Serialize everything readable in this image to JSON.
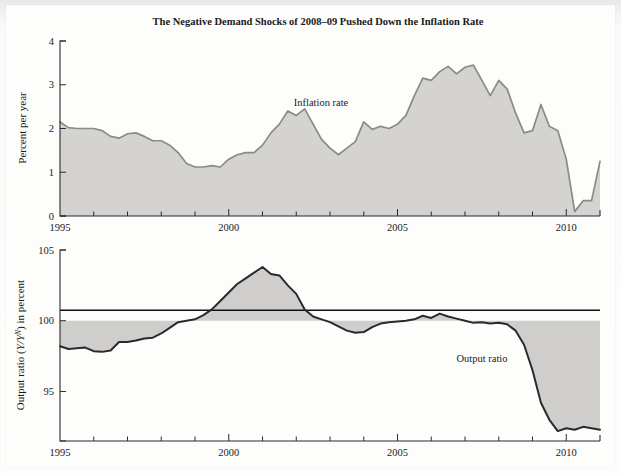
{
  "page": {
    "background_color": "#fdfdfc",
    "page_tint": "#eceaea"
  },
  "figure": {
    "title": "The Negative Demand Shocks of 2008–09 Pushed Down the Inflation Rate"
  },
  "panels": {
    "top": {
      "ylabel": "Percent per year",
      "annotation": "Inflation rate",
      "yticks": [
        "0",
        "1",
        "2",
        "3",
        "4"
      ],
      "xticks": [
        "1995",
        "2000",
        "2005",
        "2010"
      ]
    },
    "bottom": {
      "ylabel_pre": "Output ratio (",
      "ylabel_italic": "Y/Y",
      "ylabel_sup": "N",
      "ylabel_post": ") in percent",
      "ylabel_plain": "Output ratio (Y/Y^N) in percent",
      "annotation": "Output ratio",
      "yticks": [
        "95",
        "100",
        "105"
      ],
      "xticks": [
        "1995",
        "2000",
        "2005",
        "2010"
      ]
    }
  },
  "style": {
    "area_fill": "#d4d3d1",
    "line_color": "#8a8a88",
    "line_color_dark": "#2a2a2a",
    "axis_color": "#2b2b2b",
    "text_color": "#1a1a1a"
  },
  "chart_data": [
    {
      "type": "area",
      "id": "inflation-rate",
      "title": "The Negative Demand Shocks of 2008–09 Pushed Down the Inflation Rate",
      "xlabel": "",
      "ylabel": "Percent per year",
      "legend": [
        "Inflation rate"
      ],
      "legend_position": "inline-annotation",
      "grid": false,
      "xlim": [
        1995.0,
        2011.0
      ],
      "ylim": [
        0,
        4
      ],
      "yticks": [
        0,
        1,
        2,
        3,
        4
      ],
      "xticks": [
        1995,
        2000,
        2005,
        2010
      ],
      "xtick_minor_step": 1,
      "series": [
        {
          "name": "Inflation rate",
          "x": [
            1995.0,
            1995.25,
            1995.5,
            1995.75,
            1996.0,
            1996.25,
            1996.5,
            1996.75,
            1997.0,
            1997.25,
            1997.5,
            1997.75,
            1998.0,
            1998.25,
            1998.5,
            1998.75,
            1999.0,
            1999.25,
            1999.5,
            1999.75,
            2000.0,
            2000.25,
            2000.5,
            2000.75,
            2001.0,
            2001.25,
            2001.5,
            2001.75,
            2002.0,
            2002.25,
            2002.5,
            2002.75,
            2003.0,
            2003.25,
            2003.5,
            2003.75,
            2004.0,
            2004.25,
            2004.5,
            2004.75,
            2005.0,
            2005.25,
            2005.5,
            2005.75,
            2006.0,
            2006.25,
            2006.5,
            2006.75,
            2007.0,
            2007.25,
            2007.5,
            2007.75,
            2008.0,
            2008.25,
            2008.5,
            2008.75,
            2009.0,
            2009.25,
            2009.5,
            2009.75,
            2010.0,
            2010.25,
            2010.5,
            2010.75,
            2011.0
          ],
          "values": [
            2.15,
            2.02,
            2.0,
            2.0,
            2.0,
            1.95,
            1.82,
            1.78,
            1.88,
            1.9,
            1.82,
            1.72,
            1.72,
            1.62,
            1.45,
            1.2,
            1.12,
            1.12,
            1.15,
            1.12,
            1.3,
            1.4,
            1.45,
            1.45,
            1.62,
            1.9,
            2.1,
            2.4,
            2.3,
            2.45,
            2.1,
            1.75,
            1.55,
            1.4,
            1.55,
            1.7,
            2.15,
            1.98,
            2.05,
            2.0,
            2.1,
            2.3,
            2.75,
            3.15,
            3.1,
            3.3,
            3.42,
            3.25,
            3.4,
            3.45,
            3.1,
            2.75,
            3.1,
            2.9,
            2.35,
            1.9,
            1.95,
            2.55,
            2.05,
            1.95,
            1.3,
            0.1,
            0.35,
            0.35,
            1.25
          ],
          "fill": "#d4d3d1",
          "line": "#8a8a88"
        }
      ]
    },
    {
      "type": "area",
      "id": "output-ratio",
      "title": "",
      "xlabel": "",
      "ylabel": "Output ratio (Y/Y^N) in percent",
      "legend": [
        "Output ratio"
      ],
      "legend_position": "inline-annotation",
      "grid": false,
      "reference_line": 100,
      "xlim": [
        1995.0,
        2011.0
      ],
      "ylim": [
        91.5,
        105
      ],
      "yticks": [
        95,
        100,
        105
      ],
      "xticks": [
        1995,
        2000,
        2005,
        2010
      ],
      "xtick_minor_step": 1,
      "series": [
        {
          "name": "Output ratio",
          "x": [
            1995.0,
            1995.25,
            1995.5,
            1995.75,
            1996.0,
            1996.25,
            1996.5,
            1996.75,
            1997.0,
            1997.25,
            1997.5,
            1997.75,
            1998.0,
            1998.25,
            1998.5,
            1998.75,
            1999.0,
            1999.25,
            1999.5,
            1999.75,
            2000.0,
            2000.25,
            2000.5,
            2000.75,
            2001.0,
            2001.25,
            2001.5,
            2001.75,
            2002.0,
            2002.25,
            2002.5,
            2002.75,
            2003.0,
            2003.25,
            2003.5,
            2003.75,
            2004.0,
            2004.25,
            2004.5,
            2004.75,
            2005.0,
            2005.25,
            2005.5,
            2005.75,
            2006.0,
            2006.25,
            2006.5,
            2006.75,
            2007.0,
            2007.25,
            2007.5,
            2007.75,
            2008.0,
            2008.25,
            2008.5,
            2008.75,
            2009.0,
            2009.25,
            2009.5,
            2009.75,
            2010.0,
            2010.25,
            2010.5,
            2010.75,
            2011.0
          ],
          "values": [
            98.2,
            98.0,
            98.05,
            98.1,
            97.85,
            97.8,
            97.9,
            98.5,
            98.5,
            98.6,
            98.75,
            98.8,
            99.1,
            99.5,
            99.9,
            100.0,
            100.1,
            100.4,
            100.8,
            101.4,
            102.0,
            102.6,
            103.0,
            103.4,
            103.8,
            103.3,
            103.2,
            102.5,
            101.9,
            100.8,
            100.3,
            100.1,
            99.9,
            99.6,
            99.3,
            99.15,
            99.2,
            99.55,
            99.8,
            99.9,
            99.95,
            100.0,
            100.1,
            100.35,
            100.2,
            100.5,
            100.3,
            100.15,
            100.0,
            99.85,
            99.9,
            99.8,
            99.85,
            99.75,
            99.3,
            98.3,
            96.5,
            94.2,
            93.0,
            92.2,
            92.4,
            92.3,
            92.5,
            92.4,
            92.3
          ],
          "fill": "#cfcecc",
          "line": "#2a2a2a"
        }
      ]
    }
  ]
}
